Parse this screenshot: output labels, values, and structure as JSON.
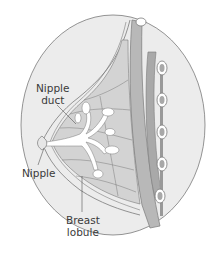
{
  "diagram": {
    "labels": {
      "nipple_duct_line1": "Nipple",
      "nipple_duct_line2": "duct",
      "nipple": "Nipple",
      "breast_lobule_line1": "Breast",
      "breast_lobule_line2": "lobule"
    },
    "colors": {
      "background_oval": "#ececec",
      "outline": "#7a7a7a",
      "breast_tissue": "#d3d3d3",
      "muscle": "#b8b8b8",
      "ducts": "#ffffff",
      "rib_fill": "#a8a8a8",
      "text": "#3a3a3a"
    }
  }
}
